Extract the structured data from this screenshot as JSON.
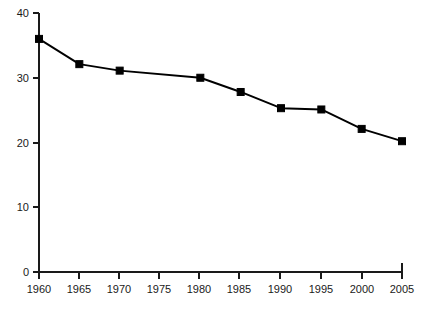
{
  "chart_data": {
    "type": "line",
    "title": "",
    "subtitle": "",
    "xlabel": "",
    "ylabel": "",
    "categories": [
      "1960",
      "1965",
      "1970",
      "1975",
      "1980",
      "1985",
      "1990",
      "1995",
      "2000",
      "2005"
    ],
    "x": [
      1960,
      1965,
      1970,
      1975,
      1980,
      1985,
      1990,
      1995,
      2000,
      2005
    ],
    "values": [
      36.0,
      32.1,
      31.1,
      null,
      30.0,
      27.8,
      25.3,
      25.1,
      22.1,
      20.2
    ],
    "series": [
      {
        "name": "series-1",
        "x": [
          1960,
          1965,
          1970,
          1980,
          1985,
          1990,
          1995,
          2000,
          2005
        ],
        "values": [
          36.0,
          32.1,
          31.1,
          30.0,
          27.8,
          25.3,
          25.1,
          22.1,
          20.2
        ],
        "color": "#000000",
        "marker": "square",
        "marker_size": 7
      }
    ],
    "xlim": [
      1960,
      2005
    ],
    "ylim": [
      0,
      40
    ],
    "x_ticks": [
      1960,
      1965,
      1970,
      1975,
      1980,
      1985,
      1990,
      1995,
      2000,
      2005
    ],
    "x_tick_labels": [
      "1960",
      "1965",
      "1970",
      "1975",
      "1980",
      "1985",
      "1990",
      "1995",
      "2000",
      "2005"
    ],
    "y_ticks": [
      0,
      10,
      20,
      30,
      40
    ],
    "y_tick_labels": [
      "0",
      "10",
      "20",
      "30",
      "40"
    ],
    "grid": false,
    "legend": false,
    "legend_position": "none",
    "annotations": [],
    "note_1975_no_marker": "The 1975 x-axis tick is labeled but carries no data marker; the line passes straight through between 1970 and 1980.",
    "colors": {
      "line": "#000000",
      "marker": "#000000",
      "axis": "#1a1a1a",
      "text": "#1a1a1a",
      "background": "#ffffff"
    }
  },
  "axis": {
    "y_label_0": "0",
    "y_label_10": "10",
    "y_label_20": "20",
    "y_label_30": "30",
    "y_label_40": "40",
    "x_label_1960": "1960",
    "x_label_1965": "1965",
    "x_label_1970": "1970",
    "x_label_1975": "1975",
    "x_label_1980": "1980",
    "x_label_1985": "1985",
    "x_label_1990": "1990",
    "x_label_1995": "1995",
    "x_label_2000": "2000",
    "x_label_2005": "2005"
  }
}
